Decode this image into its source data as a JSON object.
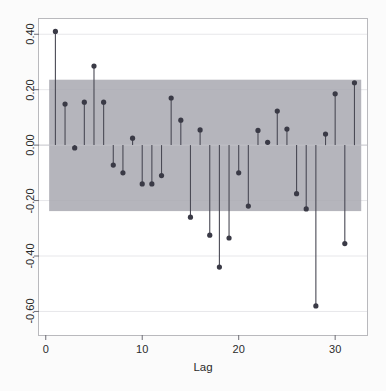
{
  "figure": {
    "title": "",
    "background_color": "#fdfdfd",
    "plot_background_color": "#ffffff",
    "frame_color": "#b9b9bd",
    "band_color": "#a8a8b0",
    "stem_color": "#4a4a55",
    "marker_color": "#3a3a46",
    "gridline_color": "#e7e7ea"
  },
  "axes": {
    "x_title": "Lag",
    "x_ticks": [
      "0",
      "10",
      "20",
      "30"
    ],
    "x_tick_values": [
      0,
      10,
      20,
      30
    ],
    "x_limits": [
      -0.7,
      33.3
    ],
    "y_ticks": [
      "0.40",
      "0.20",
      "0.00",
      "-0.20",
      "-0.40",
      "-0.60"
    ],
    "y_tick_values": [
      0.4,
      0.2,
      0.0,
      -0.2,
      -0.4,
      -0.6
    ],
    "y_limits": [
      -0.685,
      0.455
    ],
    "grid": "horizontal"
  },
  "chart_data": {
    "type": "bar",
    "subtype": "stem-autocorrelation",
    "title": "",
    "xlabel": "Lag",
    "ylabel": "",
    "xlim": [
      -0.7,
      33.3
    ],
    "ylim": [
      -0.685,
      0.455
    ],
    "categories": [
      1,
      2,
      3,
      4,
      5,
      6,
      7,
      8,
      9,
      10,
      11,
      12,
      13,
      14,
      15,
      16,
      17,
      18,
      19,
      20,
      21,
      22,
      23,
      24,
      25,
      26,
      27,
      28,
      29,
      30,
      31,
      32
    ],
    "values": [
      0.41,
      0.148,
      -0.01,
      0.155,
      0.285,
      0.155,
      -0.072,
      -0.1,
      0.025,
      -0.14,
      -0.14,
      -0.11,
      0.17,
      0.09,
      -0.26,
      0.055,
      -0.325,
      -0.44,
      -0.335,
      -0.1,
      -0.22,
      0.053,
      0.01,
      0.123,
      0.058,
      -0.175,
      -0.23,
      -0.58,
      0.04,
      0.185,
      -0.355,
      0.225
    ],
    "confidence_band": {
      "upper": 0.236,
      "lower": -0.238,
      "label": "confidence interval band"
    },
    "grid": true,
    "legend": "none"
  }
}
